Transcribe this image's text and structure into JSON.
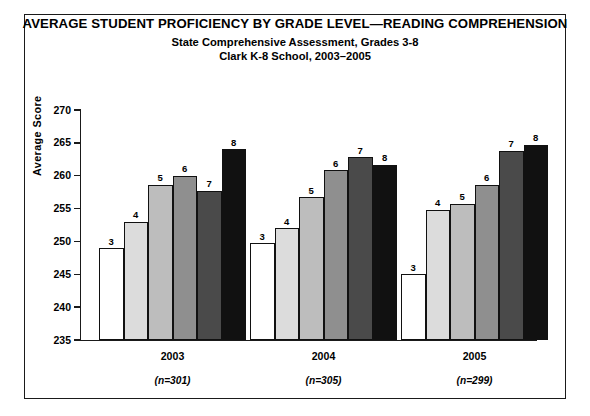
{
  "titles": {
    "main": "AVERAGE STUDENT PROFICIENCY BY GRADE LEVEL—READING COMPREHENSION",
    "sub1": "State Comprehensive Assessment, Grades 3-8",
    "sub2": "Clark K-8 School, 2003–2005"
  },
  "axis": {
    "ylabel": "Average Score",
    "yticks": [
      "270",
      "265",
      "260",
      "255",
      "250",
      "245",
      "240",
      "235"
    ]
  },
  "groups": [
    {
      "year": "2003",
      "n": "(n=301)"
    },
    {
      "year": "2004",
      "n": "(n=305)"
    },
    {
      "year": "2005",
      "n": "(n=299)"
    }
  ],
  "colors": {
    "grade3": "#ffffff",
    "grade4": "#dcdcdc",
    "grade5": "#bdbdbd",
    "grade6": "#8f8f8f",
    "grade7": "#4a4a4a",
    "grade8": "#111111",
    "outline": "#111111",
    "frame": "#1a1a1a"
  },
  "chart_data": {
    "type": "bar",
    "title": "AVERAGE STUDENT PROFICIENCY BY GRADE LEVEL—READING COMPREHENSION",
    "subtitle": "State Comprehensive Assessment, Grades 3-8 / Clark K-8 School, 2003–2005",
    "xlabel": "",
    "ylabel": "Average Score",
    "ylim": [
      235,
      270
    ],
    "ytick_step": 5,
    "grid": false,
    "legend": false,
    "bar_labels": "grade number shown above each bar",
    "categories": [
      "2003",
      "2004",
      "2005"
    ],
    "category_sublabels": [
      "(n=301)",
      "(n=305)",
      "(n=299)"
    ],
    "series": [
      {
        "name": "3",
        "values": [
          249,
          249.7,
          245
        ]
      },
      {
        "name": "4",
        "values": [
          253,
          252,
          254.8
        ]
      },
      {
        "name": "5",
        "values": [
          258.6,
          256.7,
          255.7
        ]
      },
      {
        "name": "6",
        "values": [
          260,
          260.8,
          258.6
        ]
      },
      {
        "name": "7",
        "values": [
          257.7,
          262.8,
          263.8
        ]
      },
      {
        "name": "8",
        "values": [
          264,
          261.7,
          264.7
        ]
      }
    ]
  }
}
